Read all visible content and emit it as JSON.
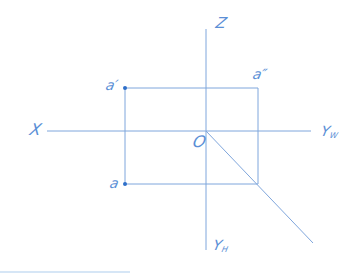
{
  "diagram": {
    "type": "three-view orthographic projection of a point",
    "colors": {
      "line": "#7fa6dc",
      "point": "#2f6fc9",
      "label": "#5b8fd6"
    },
    "axes": {
      "z": {
        "label": "Z"
      },
      "x": {
        "label": "X"
      },
      "yw": {
        "label": "Y",
        "subscript": "W"
      },
      "yh": {
        "label": "Y",
        "subscript": "H"
      },
      "origin": {
        "label": "O"
      }
    },
    "points": {
      "a_front": {
        "label": "a′"
      },
      "a_side": {
        "label": "a″"
      },
      "a_top": {
        "label": "a"
      }
    }
  }
}
